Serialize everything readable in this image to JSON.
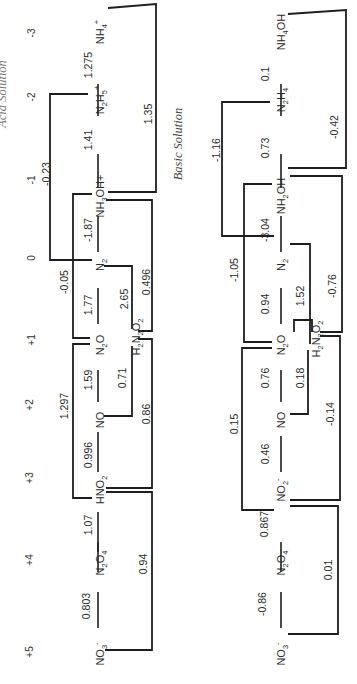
{
  "diagram": {
    "acid_title_partial": "Acid Solution",
    "basic_title": "Basic Solution",
    "oxidation_states": [
      "+5",
      "+4",
      "+3",
      "+2",
      "+1",
      "0",
      "-1",
      "-2",
      "-3"
    ],
    "acid": {
      "species": [
        {
          "base": "NO",
          "sub": "3",
          "sup": "-"
        },
        {
          "base": "N",
          "sub": "2",
          "mid": "O",
          "sub2": "4"
        },
        {
          "base": "HNO",
          "sub": "2"
        },
        {
          "base": "NO"
        },
        {
          "base": "N",
          "sub": "2",
          "mid": "O"
        },
        {
          "base": "N",
          "sub": "2"
        },
        {
          "base": "NH",
          "sub": "3",
          "mid": "OH+"
        },
        {
          "base": "N",
          "sub": "2",
          "mid": "H",
          "sub2": "5",
          "sup": "+"
        },
        {
          "base": "NH",
          "sub": "4",
          "sup": "+"
        }
      ],
      "species_text": [
        "NO3-",
        "N2O4",
        "HNO2",
        "NO",
        "N2O",
        "N2",
        "NH3OH+",
        "N2H5+",
        "NH4+"
      ],
      "adjacent_potentials": [
        "0.803",
        "1.07",
        "0.996",
        "1.59",
        "1.77",
        "-1.87",
        "1.41",
        "1.275"
      ],
      "h2n2o2": "H2N2O2",
      "skip_potentials": {
        "NO3-_to_HNO2": "0.94",
        "HNO2_to_N2O": "1.297",
        "HNO2_to_H2N2O2": "0.86",
        "NO_to_H2N2O2": "0.71",
        "H2N2O2_to_N2": "2.65",
        "H2N2O2_to_NH3OH+": "0.496",
        "N2O_to_NH3OH+": "-0.05",
        "N2_to_N2H5+": "-0.23",
        "NH3OH+_to_NH4+": "1.35"
      }
    },
    "basic": {
      "species": [
        {
          "base": "NO",
          "sub": "3",
          "sup": "-"
        },
        {
          "base": "N",
          "sub": "2",
          "mid": "O",
          "sub2": "4"
        },
        {
          "base": "NO",
          "sub": "2",
          "sup": "-"
        },
        {
          "base": "NO"
        },
        {
          "base": "N",
          "sub": "2",
          "mid": "O"
        },
        {
          "base": "N",
          "sub": "2"
        },
        {
          "base": "NH",
          "sub": "2",
          "mid": "OH"
        },
        {
          "base": "N",
          "sub": "2",
          "mid": "H",
          "sub2": "4"
        },
        {
          "base": "NH",
          "sub": "4",
          "mid": "OH"
        }
      ],
      "species_text": [
        "NO3-",
        "N2O4",
        "NO2-",
        "NO",
        "N2O",
        "N2",
        "NH2OH",
        "N2H4",
        "NH4OH"
      ],
      "adjacent_potentials": [
        "-0.86",
        "0.867",
        "0.46",
        "0.76",
        "0.94",
        "-3.04",
        "0.73",
        "0.1"
      ],
      "h2n2o2": "H2N2O2",
      "skip_potentials": {
        "NO3-_to_NO2-": "0.01",
        "NO2-_to_N2O": "0.15",
        "NO2-_to_H2N2O2": "-0.14",
        "NO_to_H2N2O2": "0.18",
        "H2N2O2_to_N2": "1.52",
        "H2N2O2_to_NH2OH": "-0.76",
        "N2O_to_NH2OH": "-1.05",
        "N2_to_N2H4": "-1.16",
        "NH2OH_to_NH4OH": "-0.42"
      }
    }
  }
}
